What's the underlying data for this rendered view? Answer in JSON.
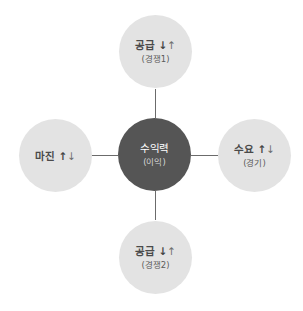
{
  "diagram": {
    "type": "hub-and-spoke",
    "colors": {
      "outer_node": "#e3e3e3",
      "center_node": "#555555",
      "connector": "#6b6b6b",
      "text_dark": "#4a4a4a",
      "text_center": "#ffffff"
    },
    "center": {
      "title": "수익력",
      "subtitle": "(이익)"
    },
    "top": {
      "title": "공급",
      "arrow_strong": "↓",
      "arrow_light": "↑",
      "subtitle": "(경쟁1)"
    },
    "left": {
      "title": "마진",
      "arrow_strong": "↑",
      "arrow_light": "↓",
      "subtitle": ""
    },
    "right": {
      "title": "수요",
      "arrow_strong": "↑",
      "arrow_light": "↓",
      "subtitle": "(경기)"
    },
    "bottom": {
      "title": "공급",
      "arrow_strong": "↓",
      "arrow_light": "↑",
      "subtitle": "(경쟁2)"
    }
  }
}
